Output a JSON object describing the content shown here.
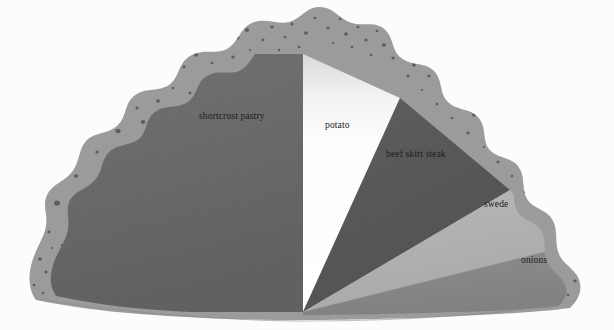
{
  "figure": {
    "background_color": "#fcfcfc",
    "width": 614,
    "height": 330
  },
  "chart_data": {
    "type": "pie",
    "title": "",
    "subtitle": "",
    "xlabel": "",
    "ylabel": "",
    "legend_position": "none",
    "grid": false,
    "style": "cornish-pasty half-pie with crimped speckled crust",
    "center": [
      303,
      312
    ],
    "radius": 258,
    "start_angle_deg": 180,
    "total_sweep_deg": 180,
    "categories": [
      "shortcrust pastry",
      "potato",
      "beef skirt steak",
      "swede",
      "onions"
    ],
    "values": [
      50,
      25,
      13,
      6,
      6
    ],
    "units": "percent of semicircle",
    "slices": [
      {
        "label": "shortcrust pastry",
        "value": 50,
        "angle_deg": 90,
        "start_deg": 180,
        "end_deg": 270,
        "color": "#6e6e6e",
        "label_x": 199,
        "label_y": 112
      },
      {
        "label": "potato",
        "value": 25,
        "angle_deg": 45,
        "start_deg": 270,
        "end_deg": 315,
        "color": "#ffffff",
        "label_x": 325,
        "label_y": 121
      },
      {
        "label": "beef skirt steak",
        "value": 13,
        "angle_deg": 23.5,
        "start_deg": 315,
        "end_deg": 338.5,
        "color": "#5c5c5c",
        "label_x": 386,
        "label_y": 150
      },
      {
        "label": "swede",
        "value": 6,
        "angle_deg": 11,
        "start_deg": 338.5,
        "end_deg": 349.5,
        "color": "#b4b4b4",
        "label_x": 484,
        "label_y": 200
      },
      {
        "label": "onions",
        "value": 6,
        "angle_deg": 10.5,
        "start_deg": 349.5,
        "end_deg": 360,
        "color": "#8b8b8b",
        "label_x": 521,
        "label_y": 256
      }
    ]
  },
  "crust": {
    "name": "crimped pastry crust",
    "color": "#9e9e9e",
    "speckle_color": "#5e5e5e",
    "speckle_count": 96
  }
}
